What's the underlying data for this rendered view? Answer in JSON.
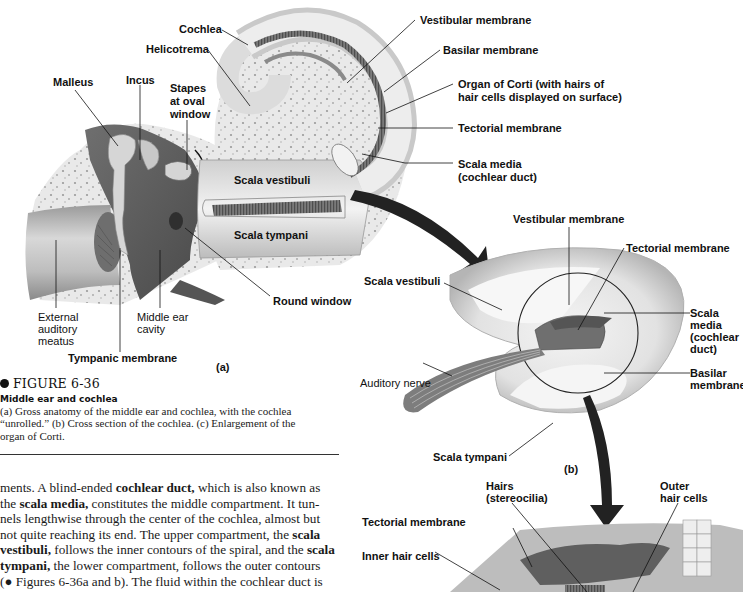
{
  "figure": {
    "number": "FIGURE 6-36",
    "subtitle": "Middle ear and cochlea",
    "caption_lines": [
      "(a) Gross anatomy of the middle ear and cochlea, with the cochlea",
      "“unrolled.” (b) Cross section of the cochlea. (c) Enlargement of the",
      "organ of Corti."
    ]
  },
  "panel_a": {
    "letter": "(a)",
    "labels": {
      "cochlea": "Cochlea",
      "helicotrema": "Helicotrema",
      "malleus": "Malleus",
      "incus": "Incus",
      "stapes_1": "Stapes",
      "stapes_2": "at oval",
      "stapes_3": "window",
      "vestibular_membrane": "Vestibular membrane",
      "basilar_membrane": "Basilar membrane",
      "organ_corti_1": "Organ of Corti (with hairs of",
      "organ_corti_2": "hair cells displayed on surface)",
      "tectorial_membrane": "Tectorial membrane",
      "scala_media_1": "Scala media",
      "scala_media_2": "(cochlear duct)",
      "scala_vestibuli": "Scala vestibuli",
      "scala_tympani": "Scala tympani",
      "round_window": "Round window",
      "external_1": "External",
      "external_2": "auditory",
      "external_3": "meatus",
      "middle_ear_1": "Middle ear",
      "middle_ear_2": "cavity",
      "tympanic_membrane": "Tympanic membrane"
    }
  },
  "panel_b": {
    "letter": "(b)",
    "labels": {
      "vestibular_membrane": "Vestibular membrane",
      "tectorial_membrane": "Tectorial membrane",
      "scala_vestibuli": "Scala vestibuli",
      "scala_media_1": "Scala",
      "scala_media_2": "media",
      "scala_media_3": "(cochlear",
      "scala_media_4": "duct)",
      "basilar_1": "Basilar",
      "basilar_2": "membrane",
      "auditory_nerve": "Auditory nerve",
      "scala_tympani": "Scala tympani"
    }
  },
  "panel_c": {
    "labels": {
      "hairs_1": "Hairs",
      "hairs_2": "(stereocilia)",
      "outer_1": "Outer",
      "outer_2": "hair cells",
      "tectorial_membrane": "Tectorial membrane",
      "inner_hair_cells": "Inner hair cells"
    }
  },
  "body_text": {
    "lines": [
      [
        {
          "t": "ments. A blind-ended "
        },
        {
          "b": "cochlear duct,"
        },
        {
          "t": " which is also known as"
        }
      ],
      [
        {
          "t": "the "
        },
        {
          "b": "scala media,"
        },
        {
          "t": " constitutes the middle compartment. It tun-"
        }
      ],
      [
        {
          "t": "nels lengthwise through the center of the cochlea, almost but"
        }
      ],
      [
        {
          "t": "not quite reaching its end. The upper compartment, the "
        },
        {
          "b": "scala"
        }
      ],
      [
        {
          "b": "vestibuli,"
        },
        {
          "t": " follows the inner contours of the spiral, and the "
        },
        {
          "b": "scala"
        }
      ],
      [
        {
          "b": "tympani,"
        },
        {
          "t": " the lower compartment, follows the outer contours"
        }
      ],
      [
        {
          "t": "(● Figures 6-36a and b). The fluid within the cochlear duct is"
        }
      ]
    ]
  }
}
